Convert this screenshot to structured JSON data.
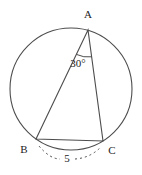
{
  "diagram": {
    "vertex_a": "A",
    "vertex_b": "B",
    "vertex_c": "C",
    "angle_a_label": "30°",
    "side_bc_label": "5"
  },
  "colors": {
    "background": "#ffffff",
    "line": "#4d4d4d",
    "text": "#1c1c1c"
  }
}
